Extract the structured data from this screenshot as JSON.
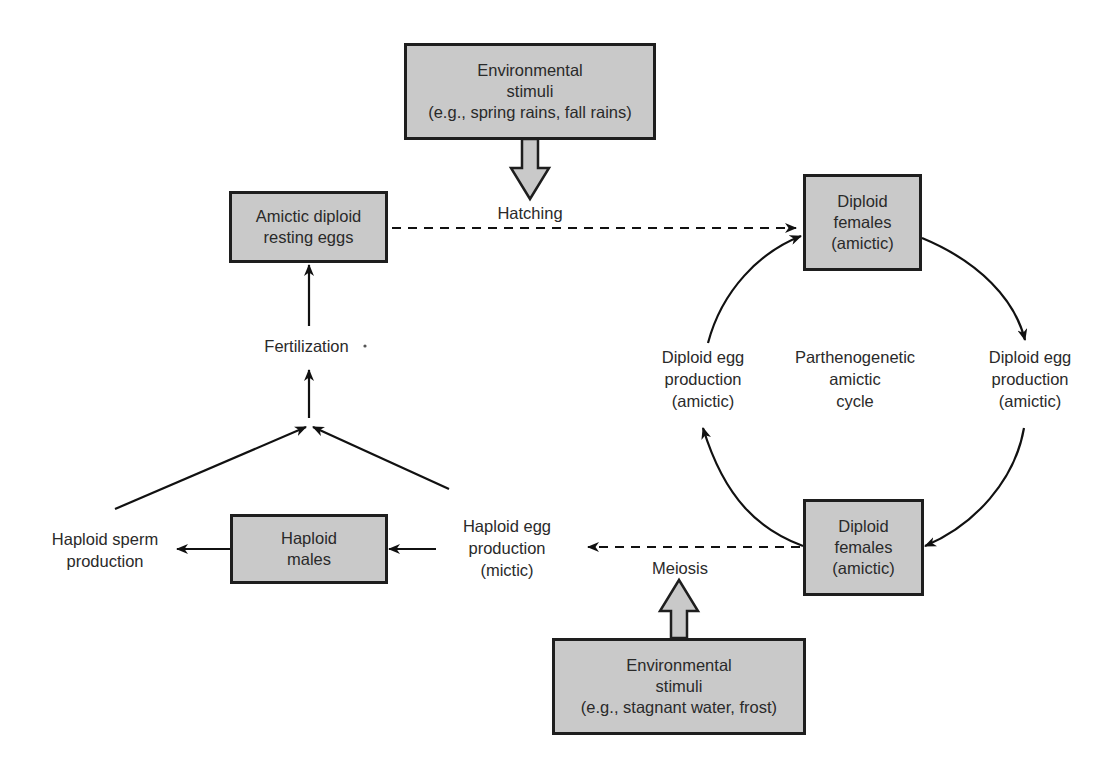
{
  "diagram": {
    "boxes": {
      "env_top": {
        "lines": [
          "Environmental",
          "stimuli",
          "(e.g., spring rains, fall rains)"
        ]
      },
      "amictic_eggs": {
        "lines": [
          "Amictic diploid",
          "resting eggs"
        ]
      },
      "diploid_females_top": {
        "lines": [
          "Diploid",
          "females",
          "(amictic)"
        ]
      },
      "diploid_females_bottom": {
        "lines": [
          "Diploid",
          "females",
          "(amictic)"
        ]
      },
      "haploid_males": {
        "lines": [
          "Haploid",
          "males"
        ]
      },
      "env_bottom": {
        "lines": [
          "Environmental",
          "stimuli",
          "(e.g., stagnant water, frost)"
        ]
      }
    },
    "labels": {
      "hatching": "Hatching",
      "fertilization": "Fertilization",
      "meiosis": "Meiosis",
      "cycle_center": [
        "Parthenogenetic",
        "amictic",
        "cycle"
      ],
      "egg_prod_right": [
        "Diploid egg",
        "production",
        "(amictic)"
      ],
      "egg_prod_left": [
        "Diploid egg",
        "production",
        "(amictic)"
      ],
      "haploid_egg": [
        "Haploid egg",
        "production",
        "(mictic)"
      ],
      "haploid_sperm": [
        "Haploid sperm",
        "production"
      ]
    },
    "edges": [
      {
        "from": "env_top",
        "to": "hatching",
        "style": "hollow-arrow"
      },
      {
        "from": "amictic_eggs",
        "to": "diploid_females_top",
        "style": "dashed",
        "label": "Hatching"
      },
      {
        "from": "diploid_females_top",
        "to": "egg_prod_right",
        "style": "curved"
      },
      {
        "from": "egg_prod_right",
        "to": "diploid_females_bottom",
        "style": "curved"
      },
      {
        "from": "diploid_females_bottom",
        "to": "egg_prod_left",
        "style": "curved"
      },
      {
        "from": "egg_prod_left",
        "to": "diploid_females_top",
        "style": "curved"
      },
      {
        "from": "diploid_females_bottom",
        "to": "haploid_egg",
        "style": "dashed",
        "label": "Meiosis"
      },
      {
        "from": "env_bottom",
        "to": "meiosis",
        "style": "hollow-arrow"
      },
      {
        "from": "haploid_egg",
        "to": "haploid_males",
        "style": "solid"
      },
      {
        "from": "haploid_males",
        "to": "haploid_sperm",
        "style": "solid"
      },
      {
        "from": "haploid_sperm",
        "to": "fertilization",
        "style": "solid"
      },
      {
        "from": "haploid_egg",
        "to": "fertilization",
        "style": "solid"
      },
      {
        "from": "fertilization",
        "to": "amictic_eggs",
        "style": "solid"
      }
    ],
    "colors": {
      "box_fill": "#c9c9c9",
      "box_border": "#1e1e1e",
      "line": "#111111",
      "text": "#2a2a2a"
    }
  }
}
